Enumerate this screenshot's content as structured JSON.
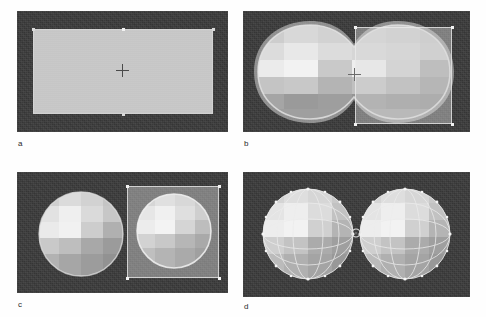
{
  "figure": {
    "type": "multi-panel-screenshot-grid",
    "background_color": "#ffffff",
    "panel_count": 4
  },
  "viewport_style": {
    "background_color": "#3b3b3b",
    "plane_color": "#c8c8c8",
    "selection_fill": "rgba(222,222,222,0.42)",
    "selection_border": "#ebebeb",
    "handle_color": "#f2f2f2",
    "cursor_color": "#4a4a4a",
    "mesh_light": "#ededed",
    "mesh_mid": "#c2c2c2",
    "mesh_dark": "#8f8f8f",
    "wire_color": "#e8e8e8"
  },
  "panels": [
    {
      "id": "a",
      "caption": "a",
      "description": "flat rectangular plane with 3D cursor crosshair at center",
      "objects": [
        "ground-plane",
        "3d-cursor",
        "edge-vertex-handles"
      ],
      "selection": "none",
      "viewport": {
        "x": 17,
        "y": 11,
        "w": 211,
        "h": 121
      }
    },
    {
      "id": "b",
      "caption": "b",
      "description": "merged peanut-shaped metaball mesh with translucent selection square over right half",
      "objects": [
        "metaball-blob-merged",
        "selection-square",
        "3d-cursor",
        "corner-handles"
      ],
      "selection": "square-right",
      "viewport": {
        "x": 243,
        "y": 11,
        "w": 227,
        "h": 121
      }
    },
    {
      "id": "c",
      "caption": "c",
      "description": "two separated faceted spheres, right sphere inside translucent selection square",
      "objects": [
        "sphere-left",
        "sphere-right",
        "selection-square",
        "corner-handles"
      ],
      "selection": "square-right",
      "viewport": {
        "x": 17,
        "y": 172,
        "w": 211,
        "h": 121
      }
    },
    {
      "id": "d",
      "caption": "d",
      "description": "two faceted spheres touching at center with wireframe edges and origin marker",
      "objects": [
        "sphere-left-wireframe",
        "sphere-right-wireframe",
        "origin-marker"
      ],
      "selection": "none",
      "viewport": {
        "x": 243,
        "y": 172,
        "w": 227,
        "h": 125
      }
    }
  ]
}
